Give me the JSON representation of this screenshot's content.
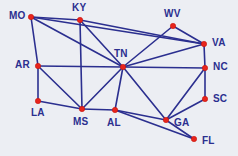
{
  "diagram": {
    "type": "node-link-graph",
    "background_color": "#eceef3",
    "node_color": "#e8241c",
    "edge_color": "#2b2f8f",
    "label_color": "#2b2f8f",
    "width": 238,
    "height": 156,
    "nodes": [
      {
        "id": "MO",
        "label": "MO",
        "x": 31,
        "y": 17,
        "label_x": 9,
        "label_y": 11
      },
      {
        "id": "KY",
        "label": "KY",
        "x": 80,
        "y": 20,
        "label_x": 72,
        "label_y": 3
      },
      {
        "id": "WV",
        "label": "WV",
        "x": 173,
        "y": 26,
        "label_x": 164,
        "label_y": 9
      },
      {
        "id": "VA",
        "label": "VA",
        "x": 204,
        "y": 44,
        "label_x": 212,
        "label_y": 38
      },
      {
        "id": "AR",
        "label": "AR",
        "x": 38,
        "y": 66,
        "label_x": 15,
        "label_y": 60
      },
      {
        "id": "TN",
        "label": "TN",
        "x": 123,
        "y": 67,
        "label_x": 114,
        "label_y": 49
      },
      {
        "id": "NC",
        "label": "NC",
        "x": 205,
        "y": 68,
        "label_x": 213,
        "label_y": 62
      },
      {
        "id": "SC",
        "label": "SC",
        "x": 205,
        "y": 99,
        "label_x": 213,
        "label_y": 94
      },
      {
        "id": "LA",
        "label": "LA",
        "x": 38,
        "y": 101,
        "label_x": 31,
        "label_y": 108
      },
      {
        "id": "MS",
        "label": "MS",
        "x": 82,
        "y": 109,
        "label_x": 73,
        "label_y": 117
      },
      {
        "id": "AL",
        "label": "AL",
        "x": 115,
        "y": 110,
        "label_x": 107,
        "label_y": 118
      },
      {
        "id": "GA",
        "label": "GA",
        "x": 166,
        "y": 120,
        "label_x": 174,
        "label_y": 118
      },
      {
        "id": "FL",
        "label": "FL",
        "x": 194,
        "y": 139,
        "label_x": 202,
        "label_y": 136
      }
    ],
    "edges": [
      {
        "from": "MO",
        "to": "KY"
      },
      {
        "from": "MO",
        "to": "AR"
      },
      {
        "from": "MO",
        "to": "TN"
      },
      {
        "from": "MO",
        "to": "VA"
      },
      {
        "from": "KY",
        "to": "TN"
      },
      {
        "from": "KY",
        "to": "VA"
      },
      {
        "from": "KY",
        "to": "MS"
      },
      {
        "from": "WV",
        "to": "VA"
      },
      {
        "from": "WV",
        "to": "TN"
      },
      {
        "from": "VA",
        "to": "TN"
      },
      {
        "from": "VA",
        "to": "NC"
      },
      {
        "from": "AR",
        "to": "TN"
      },
      {
        "from": "AR",
        "to": "LA"
      },
      {
        "from": "AR",
        "to": "MS"
      },
      {
        "from": "TN",
        "to": "NC"
      },
      {
        "from": "TN",
        "to": "MS"
      },
      {
        "from": "TN",
        "to": "AL"
      },
      {
        "from": "TN",
        "to": "GA"
      },
      {
        "from": "NC",
        "to": "SC"
      },
      {
        "from": "NC",
        "to": "GA"
      },
      {
        "from": "SC",
        "to": "GA"
      },
      {
        "from": "LA",
        "to": "MS"
      },
      {
        "from": "MS",
        "to": "AL"
      },
      {
        "from": "AL",
        "to": "GA"
      },
      {
        "from": "AL",
        "to": "FL"
      },
      {
        "from": "GA",
        "to": "FL"
      }
    ]
  }
}
